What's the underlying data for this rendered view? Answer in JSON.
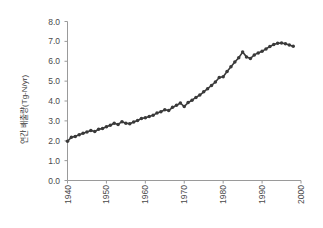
{
  "chart_data": {
    "type": "line",
    "title": "",
    "xlabel": "",
    "ylabel": "연간 배출량(Tg-N/yr)",
    "xlim": [
      1940,
      2000
    ],
    "ylim": [
      0.0,
      8.0
    ],
    "grid": false,
    "legend": null,
    "marker": "filled-circle",
    "series_color": "#3a3a3a",
    "xticks": [
      "1940",
      "1950",
      "1960",
      "1970",
      "1980",
      "1990",
      "2000"
    ],
    "xtick_values": [
      1940,
      1950,
      1960,
      1970,
      1980,
      1990,
      2000
    ],
    "yticks": [
      "0.0",
      "1.0",
      "2.0",
      "3.0",
      "4.0",
      "5.0",
      "6.0",
      "7.0",
      "8.0"
    ],
    "ytick_values": [
      0.0,
      1.0,
      2.0,
      3.0,
      4.0,
      5.0,
      6.0,
      7.0,
      8.0
    ],
    "x": [
      1940,
      1941,
      1942,
      1943,
      1944,
      1945,
      1946,
      1947,
      1948,
      1949,
      1950,
      1951,
      1952,
      1953,
      1954,
      1955,
      1956,
      1957,
      1958,
      1959,
      1960,
      1961,
      1962,
      1963,
      1964,
      1965,
      1966,
      1967,
      1968,
      1969,
      1970,
      1971,
      1972,
      1973,
      1974,
      1975,
      1976,
      1977,
      1978,
      1979,
      1980,
      1981,
      1982,
      1983,
      1984,
      1985,
      1986,
      1987,
      1988,
      1989,
      1990,
      1991,
      1992,
      1993,
      1994,
      1995,
      1996,
      1997,
      1998
    ],
    "values": [
      1.97,
      2.18,
      2.22,
      2.3,
      2.38,
      2.44,
      2.52,
      2.46,
      2.58,
      2.62,
      2.7,
      2.78,
      2.88,
      2.82,
      2.96,
      2.88,
      2.86,
      2.94,
      3.02,
      3.12,
      3.16,
      3.22,
      3.28,
      3.4,
      3.46,
      3.56,
      3.52,
      3.68,
      3.78,
      3.9,
      3.72,
      3.92,
      4.04,
      4.18,
      4.3,
      4.46,
      4.62,
      4.78,
      4.96,
      5.18,
      5.22,
      5.48,
      5.72,
      5.96,
      6.18,
      6.46,
      6.22,
      6.14,
      6.32,
      6.42,
      6.5,
      6.62,
      6.74,
      6.84,
      6.9,
      6.92,
      6.88,
      6.82,
      6.76
    ],
    "series": [
      {
        "name": "annual emission",
        "values": [
          1.97,
          2.18,
          2.22,
          2.3,
          2.38,
          2.44,
          2.52,
          2.46,
          2.58,
          2.62,
          2.7,
          2.78,
          2.88,
          2.82,
          2.96,
          2.88,
          2.86,
          2.94,
          3.02,
          3.12,
          3.16,
          3.22,
          3.28,
          3.4,
          3.46,
          3.56,
          3.52,
          3.68,
          3.78,
          3.9,
          3.72,
          3.92,
          4.04,
          4.18,
          4.3,
          4.46,
          4.62,
          4.78,
          4.96,
          5.18,
          5.22,
          5.48,
          5.72,
          5.96,
          6.18,
          6.46,
          6.22,
          6.14,
          6.32,
          6.42,
          6.5,
          6.62,
          6.74,
          6.84,
          6.9,
          6.92,
          6.88,
          6.82,
          6.76
        ]
      }
    ]
  }
}
